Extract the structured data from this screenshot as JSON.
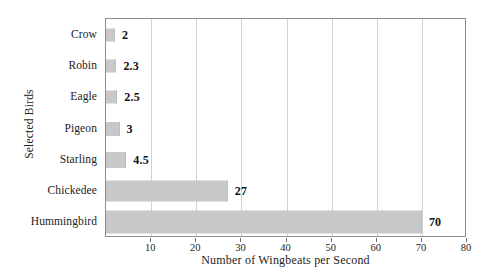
{
  "chart_data": {
    "type": "bar",
    "orientation": "horizontal",
    "title": "",
    "xlabel": "Number of Wingbeats per Second",
    "ylabel": "Selected Birds",
    "categories": [
      "Crow",
      "Robin",
      "Eagle",
      "Pigeon",
      "Starling",
      "Chickedee",
      "Hummingbird"
    ],
    "values": [
      2,
      2.3,
      2.5,
      3,
      4.5,
      27,
      70
    ],
    "value_labels": [
      "2",
      "2.3",
      "2.5",
      "3",
      "4.5",
      "27",
      "70"
    ],
    "xlim": [
      0,
      80
    ],
    "xticks": [
      10,
      20,
      30,
      40,
      50,
      60,
      70,
      80
    ],
    "xtick_labels": [
      "10",
      "20",
      "30",
      "40",
      "50",
      "60",
      "70",
      "80"
    ],
    "grid": "vertical",
    "legend": "none",
    "bar_color": "#c8c8c8",
    "frame_color": "#8c8c8c",
    "gridline_color": "#d2d2d2"
  }
}
